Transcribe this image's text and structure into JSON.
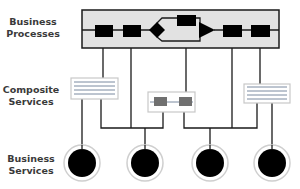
{
  "layers": {
    "business_processes": {
      "line1": "Business",
      "line2": "Processes"
    },
    "composite_services": {
      "line1": "Composite",
      "line2": "Services"
    },
    "business_services": {
      "line1": "Business",
      "line2": "Services"
    }
  },
  "colors": {
    "process_box_fill": "#e2e2e2",
    "stroke": "#1a1a1a",
    "composite_box_fill": "#ffffff",
    "composite_box_border": "#c8c8c8",
    "composite_line": "#7a8aa0",
    "service_block": "#707070",
    "circle_fill": "#000000",
    "circle_ring": "#cfcfcf"
  },
  "icons": {
    "process_step": "filled-square",
    "decision": "diamond",
    "merge": "triangle-arrow",
    "composite_doc": "lined-document",
    "composite_chain": "linked-blocks",
    "service": "filled-circle"
  }
}
